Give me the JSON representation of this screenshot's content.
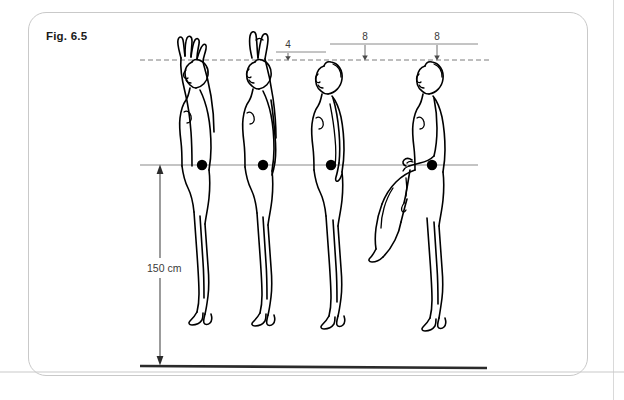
{
  "figure": {
    "label": "Fig. 6.5",
    "caption_id": "6.5"
  },
  "annotations": {
    "top_measurements": [
      {
        "name": "offset-4",
        "value": "4",
        "x": 288,
        "tick_x": 288,
        "label_y": 45,
        "line_y": 52
      },
      {
        "name": "offset-8-a",
        "value": "8",
        "x": 365,
        "tick_x": 365,
        "label_y": 37,
        "line_y": 44
      },
      {
        "name": "offset-8-b",
        "value": "8",
        "x": 437,
        "tick_x": 437,
        "label_y": 37,
        "line_y": 44
      }
    ],
    "vertical_dimension": {
      "name": "height-150cm",
      "value": "150 cm",
      "x": 160,
      "top_y": 165,
      "bottom_y": 362,
      "label_y": 268
    }
  },
  "reference_lines": {
    "dashed_head_line": {
      "y": 60,
      "x1": 140,
      "x2": 492,
      "style": "dashed"
    },
    "cog_line": {
      "y": 165,
      "x1": 140,
      "x2": 478,
      "style": "solid"
    },
    "top_solid_line_a": {
      "y": 52,
      "x1": 276,
      "x2": 326,
      "style": "solid"
    },
    "top_solid_line_b": {
      "y": 44,
      "x1": 330,
      "x2": 478,
      "style": "solid"
    },
    "ground_line": {
      "y": 366,
      "x1": 140,
      "x2": 487,
      "style": "thick"
    }
  },
  "figures": [
    {
      "name": "figure-arms-overhead",
      "pose": "standing, both arms raised fully overhead",
      "cog": {
        "x": 202,
        "y": 165
      },
      "head_top_y": 62
    },
    {
      "name": "figure-one-arm-raised",
      "pose": "standing, one arm raised overhead",
      "cog": {
        "x": 263,
        "y": 165
      },
      "head_top_y": 52
    },
    {
      "name": "figure-standing-neutral",
      "pose": "standing upright, arms at sides",
      "cog": {
        "x": 331,
        "y": 165
      },
      "head_top_y": 60
    },
    {
      "name": "figure-leg-raised",
      "pose": "standing on one leg, other leg raised with knee bent",
      "cog": {
        "x": 432,
        "y": 165
      },
      "head_top_y": 60
    }
  ],
  "colors": {
    "ink": "#000000",
    "panel_border": "#c9c9c9",
    "guide_line": "#8a8a8a",
    "ground": "#2b2b2b",
    "background": "#ffffff"
  }
}
